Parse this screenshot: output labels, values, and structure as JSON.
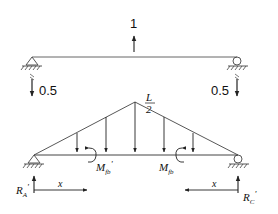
{
  "top_beam": {
    "load_label": "1",
    "left_reaction_label": "0.5",
    "right_reaction_label": "0.5"
  },
  "bottom_beam": {
    "peak_label_num": "L",
    "peak_label_den": "2",
    "moment_left_label": "M",
    "moment_left_sub": "fb",
    "moment_left_prime": "'",
    "moment_right_label": "M",
    "moment_right_sub": "fb",
    "reaction_left_label": "R",
    "reaction_left_sub": "A",
    "reaction_left_prime": "'",
    "reaction_right_label": "R",
    "reaction_right_sub": "C",
    "reaction_right_prime": "'",
    "x_left_label": "x",
    "x_right_label": "x"
  },
  "colors": {
    "line": "#333333",
    "background": "#ffffff"
  }
}
